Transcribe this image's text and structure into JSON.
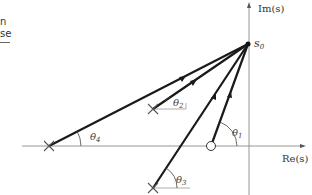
{
  "page_fragment": {
    "line1": "n",
    "line2": "se"
  },
  "axes": {
    "imag_label": "Im(s)",
    "real_label": "Re(s)"
  },
  "point": {
    "label": "s",
    "subscript": "0"
  },
  "angles": {
    "theta1": {
      "symbol": "θ",
      "index": "1"
    },
    "theta2": {
      "symbol": "θ",
      "index": "2"
    },
    "theta3": {
      "symbol": "θ",
      "index": "3"
    },
    "theta4": {
      "symbol": "θ",
      "index": "4"
    }
  },
  "elements": {
    "s0": [
      248,
      44
    ],
    "zero": [
      211,
      146
    ],
    "poles": [
      [
        49,
        146
      ],
      [
        153,
        109
      ],
      [
        153,
        188
      ]
    ]
  }
}
